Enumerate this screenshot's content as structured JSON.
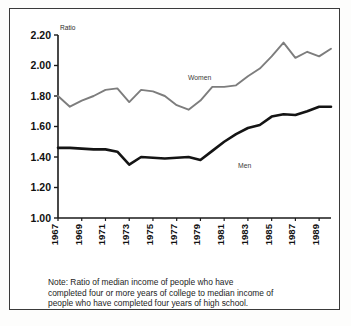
{
  "figure": {
    "border_color": "#3a3a3a",
    "background": "#ffffff"
  },
  "note": {
    "line1": "Note: Ratio of median income of people who have",
    "line2": "completed four or more years of college to median income of",
    "line3": "people who have completed four years of high school."
  },
  "chart_data": {
    "type": "line",
    "title": "",
    "xlabel": "",
    "ylabel": "Ratio",
    "ylim": [
      1.0,
      2.2
    ],
    "xlim": [
      1967,
      1990
    ],
    "grid": false,
    "legend_position": "inline-annotation",
    "ytick_labels": [
      "1.00",
      "1.20",
      "1.40",
      "1.60",
      "1.80",
      "2.00",
      "2.20"
    ],
    "ytick_values": [
      1.0,
      1.2,
      1.4,
      1.6,
      1.8,
      2.0,
      2.2
    ],
    "x": [
      1967,
      1968,
      1969,
      1970,
      1971,
      1972,
      1973,
      1974,
      1975,
      1976,
      1977,
      1978,
      1979,
      1980,
      1981,
      1982,
      1983,
      1984,
      1985,
      1986,
      1987,
      1988,
      1989,
      1990
    ],
    "xtick_labels": [
      "1967",
      "1969",
      "1971",
      "1973",
      "1975",
      "1977",
      "1979",
      "1981",
      "1983",
      "1985",
      "1987",
      "1989"
    ],
    "xtick_values": [
      1967,
      1969,
      1971,
      1973,
      1975,
      1977,
      1979,
      1981,
      1983,
      1985,
      1987,
      1989
    ],
    "xtick_rotation": -90,
    "series": [
      {
        "name": "Women",
        "color": "#7d7d7d",
        "label_text": "Women",
        "values": [
          1.8,
          1.73,
          1.77,
          1.8,
          1.84,
          1.85,
          1.76,
          1.84,
          1.83,
          1.8,
          1.74,
          1.71,
          1.77,
          1.86,
          1.86,
          1.87,
          1.93,
          1.98,
          2.06,
          2.15,
          2.05,
          2.09,
          2.06,
          2.11
        ]
      },
      {
        "name": "Men",
        "color": "#141414",
        "label_text": "Men",
        "values": [
          1.46,
          1.46,
          1.455,
          1.45,
          1.45,
          1.435,
          1.35,
          1.4,
          1.395,
          1.39,
          1.395,
          1.4,
          1.38,
          1.44,
          1.5,
          1.55,
          1.59,
          1.61,
          1.665,
          1.68,
          1.675,
          1.7,
          1.73,
          1.73
        ]
      }
    ]
  }
}
